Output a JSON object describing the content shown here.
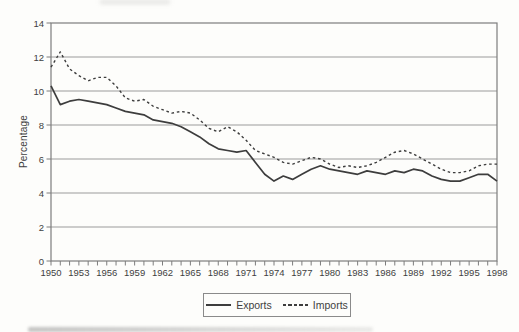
{
  "chart_data": {
    "type": "line",
    "title": "",
    "xlabel": "",
    "ylabel": "Percentage",
    "ylim": [
      0,
      14
    ],
    "ytick_step": 2,
    "ytick_labels": [
      "0",
      "2",
      "4",
      "6",
      "8",
      "10",
      "12",
      "14"
    ],
    "x_start": 1950,
    "x_end": 1998,
    "x_step": 1,
    "xtick_label_every": 3,
    "xtick_labels": [
      "1950",
      "1953",
      "1956",
      "1959",
      "1962",
      "1965",
      "1968",
      "1971",
      "1974",
      "1977",
      "1980",
      "1983",
      "1986",
      "1989",
      "1992",
      "1995",
      "1998"
    ],
    "grid": "horizontal",
    "legend_position": "bottom-center",
    "series": [
      {
        "name": "Exports",
        "line_style": "solid",
        "color": "#3d3d3d",
        "values": [
          10.3,
          9.2,
          9.4,
          9.5,
          9.4,
          9.3,
          9.2,
          9.0,
          8.8,
          8.7,
          8.6,
          8.3,
          8.2,
          8.1,
          7.9,
          7.6,
          7.3,
          6.9,
          6.6,
          6.5,
          6.4,
          6.5,
          5.8,
          5.1,
          4.7,
          5.0,
          4.8,
          5.1,
          5.4,
          5.6,
          5.4,
          5.3,
          5.2,
          5.1,
          5.3,
          5.2,
          5.1,
          5.3,
          5.2,
          5.4,
          5.3,
          5.0,
          4.8,
          4.7,
          4.7,
          4.9,
          5.1,
          5.1,
          4.7
        ]
      },
      {
        "name": "Imports",
        "line_style": "dashed",
        "color": "#3d3d3d",
        "values": [
          11.4,
          12.3,
          11.3,
          10.9,
          10.6,
          10.8,
          10.8,
          10.3,
          9.6,
          9.4,
          9.5,
          9.1,
          8.9,
          8.7,
          8.8,
          8.7,
          8.3,
          7.8,
          7.6,
          7.9,
          7.6,
          7.1,
          6.5,
          6.3,
          6.1,
          5.8,
          5.7,
          5.9,
          6.1,
          6.0,
          5.7,
          5.5,
          5.6,
          5.5,
          5.6,
          5.8,
          6.1,
          6.4,
          6.5,
          6.3,
          6.0,
          5.7,
          5.4,
          5.2,
          5.2,
          5.3,
          5.6,
          5.7,
          5.7
        ]
      }
    ]
  },
  "colors": {
    "background": "#fdfdfb",
    "grid": "#9b9b9b",
    "axis_border": "#7d7d7d",
    "tick": "#7d7d7d",
    "text": "#3f3f3f",
    "line": "#3d3d3d",
    "legend_border": "#8a8a8a"
  }
}
